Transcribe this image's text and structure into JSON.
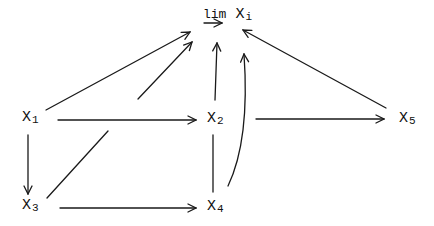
{
  "diagram": {
    "type": "commutative-diagram",
    "limit_label": {
      "operator": "lim",
      "variable": "X",
      "subscript": "i",
      "operator_arrow": "right"
    },
    "nodes": [
      {
        "id": "X1",
        "name": "X",
        "subscript": "1"
      },
      {
        "id": "X2",
        "name": "X",
        "subscript": "2"
      },
      {
        "id": "X3",
        "name": "X",
        "subscript": "3"
      },
      {
        "id": "X4",
        "name": "X",
        "subscript": "4"
      },
      {
        "id": "X5",
        "name": "X",
        "subscript": "5"
      }
    ],
    "edges": [
      {
        "from": "X1",
        "to": "lim"
      },
      {
        "from": "X3",
        "to": "lim",
        "style": "broken (passes under X1→X2)"
      },
      {
        "from": "X2",
        "to": "lim"
      },
      {
        "from": "X4",
        "to": "lim",
        "style": "curved"
      },
      {
        "from": "X5",
        "to": "lim"
      },
      {
        "from": "X1",
        "to": "X2"
      },
      {
        "from": "X2",
        "to": "X5"
      },
      {
        "from": "X1",
        "to": "X3"
      },
      {
        "from": "X3",
        "to": "X4"
      },
      {
        "from": "X2",
        "to": "X4",
        "style": "line, no arrowhead"
      }
    ]
  }
}
